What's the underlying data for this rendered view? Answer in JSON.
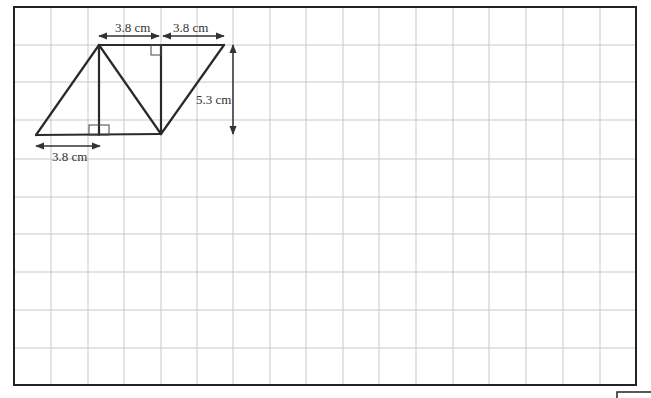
{
  "diagram": {
    "type": "parallelogram-composition-on-grid",
    "colors": {
      "grid": "#c9c9c9",
      "border": "#222222",
      "shape": "#2a2a2a",
      "text": "#333333"
    },
    "labels": {
      "top_left_width": "3.8 cm",
      "top_right_width": "3.8 cm",
      "height": "5.3 cm",
      "bottom_width": "3.8 cm"
    },
    "grid": {
      "columns": 17,
      "rows": 10,
      "left": 14,
      "top": 7,
      "right": 636,
      "bottom": 385
    }
  }
}
